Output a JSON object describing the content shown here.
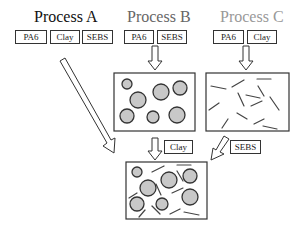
{
  "processes": [
    {
      "title": "Process A",
      "color": "#111111",
      "components": [
        "PA6",
        "Clay",
        "SEBS"
      ]
    },
    {
      "title": "Process B",
      "color": "#666666",
      "components": [
        "PA6",
        "SEBS"
      ]
    },
    {
      "title": "Process C",
      "color": "#999999",
      "components": [
        "PA6",
        "Clay"
      ]
    }
  ],
  "additions": {
    "from_b": "Clay",
    "from_c": "SEBS"
  },
  "morphology": {
    "b": "SEBS particles dispersed in PA6",
    "c": "Clay platelets dispersed in PA6",
    "final": "PA6 with SEBS particles and clay platelets"
  },
  "colors": {
    "particle_fill": "#c8c8c8",
    "stroke": "#333333"
  }
}
